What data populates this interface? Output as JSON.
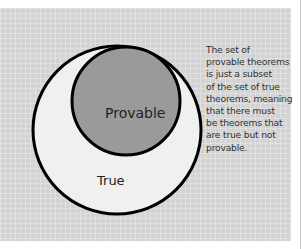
{
  "diagram": {
    "type": "nested-set-venn",
    "outer_set": {
      "label": "True",
      "fill": "#f0f0f0",
      "stroke": "#000000"
    },
    "inner_set": {
      "label": "Provable",
      "fill": "#9a9a9a",
      "stroke": "#000000"
    },
    "background": "#d3d3d3"
  },
  "annotation": {
    "lines": [
      "The set of",
      "provable theorems",
      "is just a subset",
      "of the set of true",
      "theorems, meaning",
      "that there must",
      "be theorems that",
      "are true but not",
      "provable."
    ]
  }
}
